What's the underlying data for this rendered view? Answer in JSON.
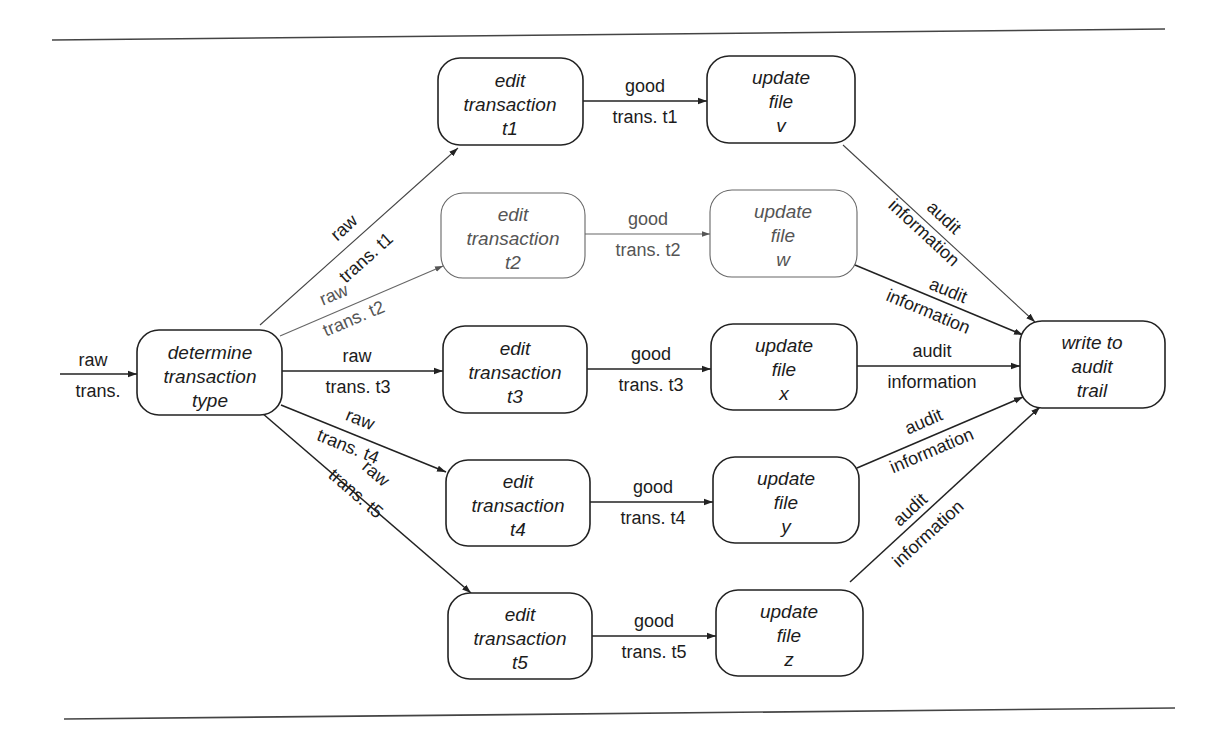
{
  "diagram": {
    "type": "transaction processing data flow (transform-centered / transaction-centered)",
    "nodes": [
      {
        "id": "determine",
        "lines": [
          "determine",
          "transaction",
          "type"
        ]
      },
      {
        "id": "edit_t1",
        "lines": [
          "edit",
          "transaction",
          "t1"
        ]
      },
      {
        "id": "edit_t2",
        "lines": [
          "edit",
          "transaction",
          "t2"
        ],
        "faded": true
      },
      {
        "id": "edit_t3",
        "lines": [
          "edit",
          "transaction",
          "t3"
        ]
      },
      {
        "id": "edit_t4",
        "lines": [
          "edit",
          "transaction",
          "t4"
        ]
      },
      {
        "id": "edit_t5",
        "lines": [
          "edit",
          "transaction",
          "t5"
        ]
      },
      {
        "id": "update_v",
        "lines": [
          "update",
          "file",
          "v"
        ]
      },
      {
        "id": "update_w",
        "lines": [
          "update",
          "file",
          "w"
        ],
        "faded": true
      },
      {
        "id": "update_x",
        "lines": [
          "update",
          "file",
          "x"
        ]
      },
      {
        "id": "update_y",
        "lines": [
          "update",
          "file",
          "y"
        ]
      },
      {
        "id": "update_z",
        "lines": [
          "update",
          "file",
          "z"
        ]
      },
      {
        "id": "audit",
        "lines": [
          "write to",
          "audit",
          "trail"
        ]
      }
    ],
    "edges": [
      {
        "from": "input",
        "to": "determine",
        "label_top": "raw",
        "label_bottom": "trans."
      },
      {
        "from": "determine",
        "to": "edit_t1",
        "label_top": "raw",
        "label_bottom": "trans. t1"
      },
      {
        "from": "determine",
        "to": "edit_t2",
        "label_top": "raw",
        "label_bottom": "trans. t2"
      },
      {
        "from": "determine",
        "to": "edit_t3",
        "label_top": "raw",
        "label_bottom": "trans. t3"
      },
      {
        "from": "determine",
        "to": "edit_t4",
        "label_top": "raw",
        "label_bottom": "trans. t4"
      },
      {
        "from": "determine",
        "to": "edit_t5",
        "label_top": "raw",
        "label_bottom": "trans. t5"
      },
      {
        "from": "edit_t1",
        "to": "update_v",
        "label_top": "good",
        "label_bottom": "trans. t1"
      },
      {
        "from": "edit_t2",
        "to": "update_w",
        "label_top": "good",
        "label_bottom": "trans. t2"
      },
      {
        "from": "edit_t3",
        "to": "update_x",
        "label_top": "good",
        "label_bottom": "trans. t3"
      },
      {
        "from": "edit_t4",
        "to": "update_y",
        "label_top": "good",
        "label_bottom": "trans. t4"
      },
      {
        "from": "edit_t5",
        "to": "update_z",
        "label_top": "good",
        "label_bottom": "trans. t5"
      },
      {
        "from": "update_v",
        "to": "audit",
        "label_top": "audit",
        "label_bottom": "information"
      },
      {
        "from": "update_w",
        "to": "audit",
        "label_top": "audit",
        "label_bottom": "information"
      },
      {
        "from": "update_x",
        "to": "audit",
        "label_top": "audit",
        "label_bottom": "information"
      },
      {
        "from": "update_y",
        "to": "audit",
        "label_top": "audit",
        "label_bottom": "information"
      },
      {
        "from": "update_z",
        "to": "audit",
        "label_top": "audit",
        "label_bottom": "information"
      }
    ]
  },
  "colors": {
    "stroke": "#222222",
    "faded_stroke": "#666666",
    "text": "#1c1c1c",
    "faded_text": "#555555",
    "background": "#ffffff"
  }
}
